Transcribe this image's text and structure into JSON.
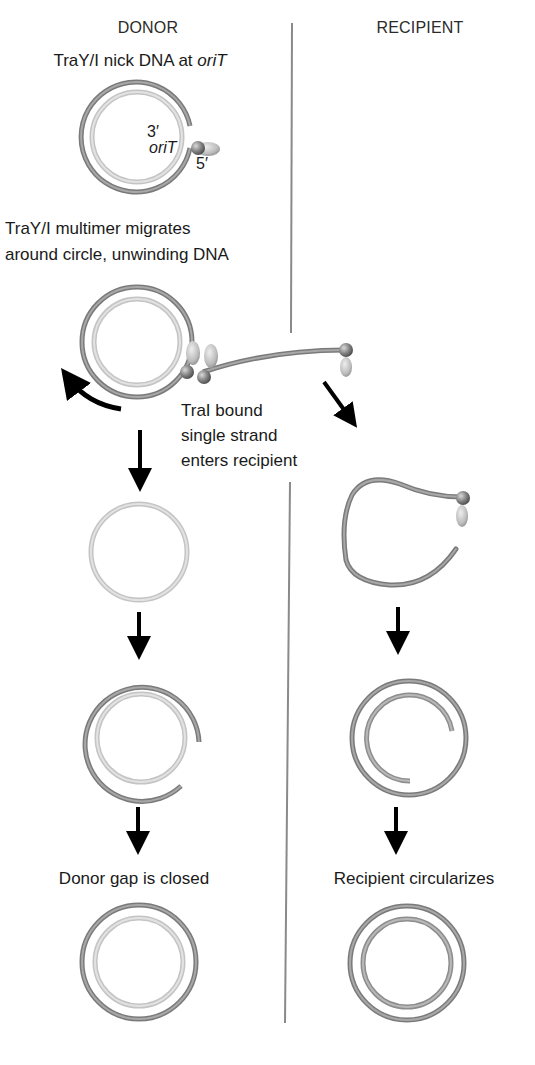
{
  "diagram": {
    "type": "process-flow",
    "columns": {
      "donor": "DONOR",
      "recipient": "RECIPIENT"
    },
    "steps": [
      {
        "id": 1,
        "label_parts": [
          "TraY/I nick DNA at ",
          "oriT"
        ],
        "italic_part": "oriT",
        "column": "donor"
      },
      {
        "id": 2,
        "label_lines": [
          "TraY/I multimer migrates",
          "around circle, unwinding DNA"
        ],
        "column": "donor"
      },
      {
        "id": 3,
        "label_lines": [
          "TraI bound",
          "single strand",
          "enters recipient"
        ],
        "column": "both"
      },
      {
        "id": 4,
        "label": "Donor gap is closed",
        "column": "donor"
      },
      {
        "id": 5,
        "label": "Recipient circularizes",
        "column": "recipient"
      }
    ],
    "annotations": {
      "orit": "oriT",
      "three_prime": "3′",
      "five_prime": "5′"
    },
    "legend_colors": {
      "template_strand": "#8a8a8a",
      "light_strand": "#c8c8c8",
      "new_strand": "#9a9a9a",
      "protein_sphere": "#7d7d7d",
      "protein_ellipsoid": "#bdbdbd",
      "arrow": "#000000",
      "divider": "#808080"
    }
  }
}
